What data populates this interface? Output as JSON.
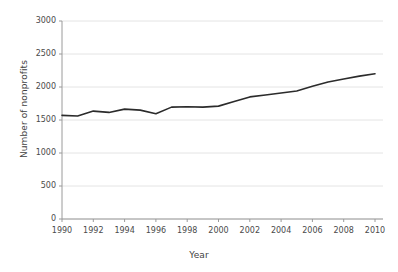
{
  "chart_data": {
    "type": "line",
    "title": "",
    "subtitle": "",
    "xlabel": "Year",
    "ylabel": "Number of nonprofits",
    "x": [
      1990,
      1991,
      1992,
      1993,
      1994,
      1995,
      1996,
      1997,
      1998,
      1999,
      2000,
      2001,
      2002,
      2003,
      2004,
      2005,
      2006,
      2007,
      2008,
      2009,
      2010
    ],
    "values": [
      1570,
      1560,
      1635,
      1615,
      1665,
      1650,
      1595,
      1695,
      1700,
      1695,
      1710,
      1780,
      1850,
      1880,
      1910,
      1940,
      2010,
      2075,
      2120,
      2165,
      2200
    ],
    "series": [
      {
        "name": "Number of nonprofits",
        "values": [
          1570,
          1560,
          1635,
          1615,
          1665,
          1650,
          1595,
          1695,
          1700,
          1695,
          1710,
          1780,
          1850,
          1880,
          1910,
          1940,
          2010,
          2075,
          2120,
          2165,
          2200
        ]
      }
    ],
    "xlim": [
      1990,
      2010
    ],
    "ylim": [
      0,
      3000
    ],
    "xticks": [
      1990,
      1992,
      1994,
      1996,
      1998,
      2000,
      2002,
      2004,
      2006,
      2008,
      2010
    ],
    "xtick_labels": [
      "1990",
      "1992",
      "1994",
      "1996",
      "1998",
      "2000",
      "2002",
      "2004",
      "2006",
      "2008",
      "2010"
    ],
    "yticks": [
      0,
      500,
      1000,
      1500,
      2000,
      2500,
      3000
    ],
    "ytick_labels": [
      "0",
      "500",
      "1000",
      "1500",
      "2000",
      "2500",
      "3000"
    ],
    "grid": "horizontal",
    "legend": "none",
    "line_color": "#2b2b2b",
    "grid_color": "#e4e4e4",
    "axis_color": "#9a9a9a",
    "background_color": "#ffffff"
  }
}
